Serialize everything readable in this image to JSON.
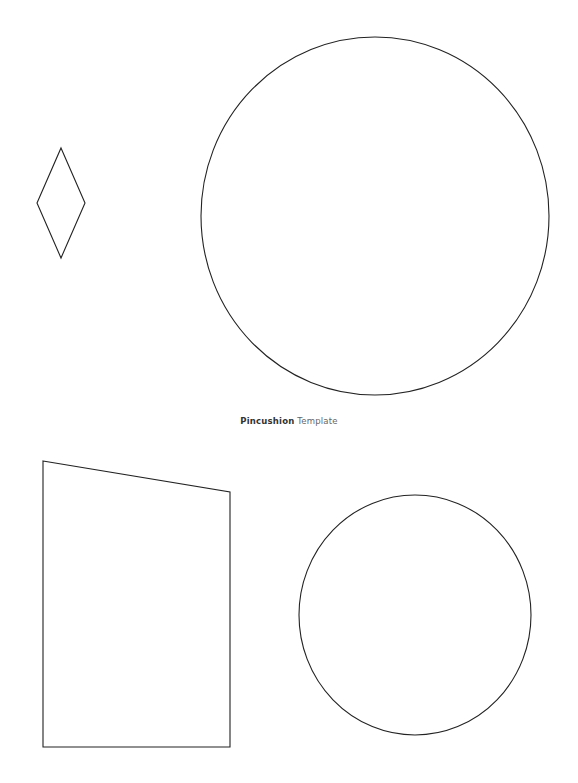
{
  "caption": {
    "title_bold": "Pincushion",
    "title_rest": "Template"
  },
  "shapes": {
    "stroke_color": "#222222",
    "diamond": {
      "points": "61,148 85,203 61,258 37,203"
    },
    "large_circle": {
      "cx": 375,
      "cy": 216,
      "rx": 174,
      "ry": 179
    },
    "trapezoid": {
      "points": "43,461 230,492 230,747 43,747"
    },
    "small_circle": {
      "cx": 415,
      "cy": 615,
      "rx": 116,
      "ry": 120
    }
  }
}
